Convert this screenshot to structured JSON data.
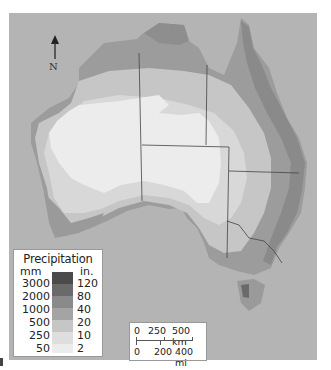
{
  "map": {
    "subject": "Australia annual precipitation",
    "north_label": "N",
    "colors": {
      "ocean": "#b4b4b4",
      "band_2in": "#ececec",
      "band_10in": "#d8d8d8",
      "band_20in": "#c6c6c6",
      "band_40in": "#a6a6a6",
      "band_80in": "#8a8a8a",
      "band_120in": "#5a5a5a",
      "border_line": "#444444"
    }
  },
  "legend": {
    "title": "Precipitation",
    "unit_metric": "mm",
    "unit_imperial": "in.",
    "classes": [
      {
        "mm": "3000",
        "in": "120",
        "color": "#4a4a4a"
      },
      {
        "mm": "2000",
        "in": "80",
        "color": "#6a6a6a"
      },
      {
        "mm": "1000",
        "in": "40",
        "color": "#8a8a8a"
      },
      {
        "mm": "500",
        "in": "20",
        "color": "#a4a4a4"
      },
      {
        "mm": "250",
        "in": "10",
        "color": "#c6c6c6"
      },
      {
        "mm": "50",
        "in": "2",
        "color": "#dedede"
      },
      {
        "mm": "",
        "in": "",
        "color": "#ececec"
      }
    ]
  },
  "scale": {
    "km_labels": [
      "0",
      "250",
      "500 km"
    ],
    "mi_labels": [
      "0",
      "200",
      "400 mi"
    ]
  }
}
